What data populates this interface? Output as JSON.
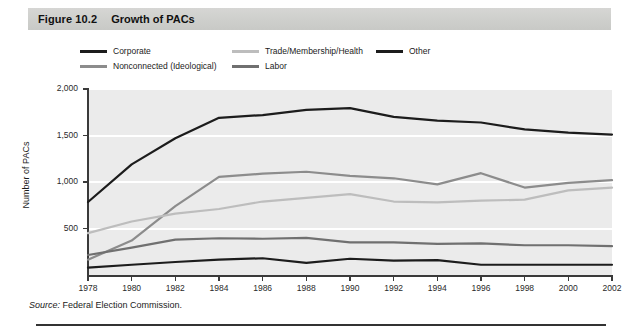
{
  "figure": {
    "number": "Figure 10.2",
    "title": "Growth of PACs"
  },
  "source": {
    "label": "Source:",
    "text": " Federal Election Commission."
  },
  "colors": {
    "corporate": "#1c1c1c",
    "nonconnected": "#8c8c8c",
    "trade": "#bdbdbd",
    "labor": "#707070",
    "other": "#1c1c1c",
    "plot_background": "#ebebeb",
    "gridline": "#ffffff",
    "axis": "#3a3a3a",
    "title_bar": "#d0d0ce"
  },
  "chart_data": {
    "type": "line",
    "title": "Growth of PACs",
    "xlabel": "",
    "ylabel": "Number of PACs",
    "xlim": [
      1978,
      2002
    ],
    "ylim": [
      0,
      2000
    ],
    "yticks": [
      "500",
      "1,000",
      "1,500",
      "2,000"
    ],
    "ytick_values": [
      500,
      1000,
      1500,
      2000
    ],
    "grid": true,
    "legend_position": "above-plot",
    "x": [
      1978,
      1980,
      1982,
      1984,
      1986,
      1988,
      1990,
      1992,
      1994,
      1996,
      1998,
      2000,
      2002
    ],
    "xtick_labels": [
      "1978",
      "1980",
      "1982",
      "1984",
      "1986",
      "1988",
      "1990",
      "1992",
      "1994",
      "1996",
      "1998",
      "2000",
      "2002"
    ],
    "series": [
      {
        "name": "Corporate",
        "color": "#1c1c1c",
        "values": [
          785,
          1190,
          1470,
          1690,
          1720,
          1775,
          1795,
          1700,
          1660,
          1640,
          1565,
          1530,
          1510
        ]
      },
      {
        "name": "Nonconnected (Ideological)",
        "color": "#8c8c8c",
        "values": [
          165,
          370,
          740,
          1055,
          1090,
          1110,
          1065,
          1040,
          975,
          1095,
          940,
          990,
          1020
        ]
      },
      {
        "name": "Trade/Membership/Health",
        "color": "#bdbdbd",
        "values": [
          450,
          575,
          660,
          710,
          790,
          830,
          870,
          790,
          780,
          800,
          810,
          910,
          940
        ]
      },
      {
        "name": "Labor",
        "color": "#707070",
        "values": [
          215,
          295,
          380,
          395,
          390,
          400,
          350,
          350,
          335,
          340,
          320,
          320,
          310
        ]
      },
      {
        "name": "Other",
        "color": "#1c1c1c",
        "values": [
          80,
          110,
          140,
          165,
          180,
          130,
          175,
          155,
          160,
          110,
          110,
          110,
          110
        ]
      }
    ]
  },
  "legend": [
    {
      "label": "Corporate",
      "color": "#1c1c1c",
      "left": 0,
      "top": 0
    },
    {
      "label": "Nonconnected (Ideological)",
      "color": "#8c8c8c",
      "left": 0,
      "top": 15
    },
    {
      "label": "Trade/Membership/Health",
      "color": "#bdbdbd",
      "left": 152,
      "top": 0
    },
    {
      "label": "Labor",
      "color": "#707070",
      "left": 152,
      "top": 15
    },
    {
      "label": "Other",
      "color": "#1c1c1c",
      "left": 296,
      "top": 0
    }
  ]
}
